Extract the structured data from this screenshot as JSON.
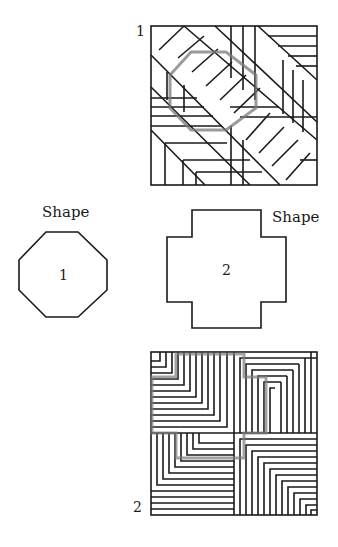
{
  "puzzle_1": {
    "label": "1",
    "highlight_shape": "octagon"
  },
  "puzzle_2": {
    "label": "2",
    "highlight_shape": "cross"
  },
  "shapes": [
    {
      "caption": "Shape",
      "number": "1",
      "type": "octagon"
    },
    {
      "caption": "Shape",
      "number": "2",
      "type": "cross"
    }
  ],
  "colors": {
    "line": "#1a1a1a",
    "highlight": "#7a7a7a",
    "background": "#ffffff"
  }
}
